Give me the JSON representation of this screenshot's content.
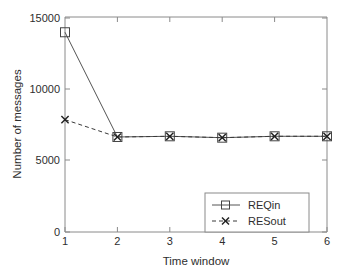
{
  "chart_data": {
    "type": "line",
    "title": "",
    "xlabel": "Time window",
    "ylabel": "Number of messages",
    "x": [
      1,
      2,
      3,
      4,
      5,
      6
    ],
    "xlim": [
      1,
      6
    ],
    "ylim": [
      0,
      15500
    ],
    "xticks": [
      "1",
      "2",
      "3",
      "4",
      "5",
      "6"
    ],
    "yticks": [
      "0",
      "5000",
      "10000",
      "15000"
    ],
    "ytick_values": [
      0,
      5000,
      10000,
      15000
    ],
    "grid": false,
    "legend_position": "lower right",
    "series": [
      {
        "name": "REQin",
        "values": [
          14400,
          6850,
          6900,
          6800,
          6900,
          6900
        ],
        "marker": "square",
        "linestyle": "solid",
        "color": "#555555"
      },
      {
        "name": "RESout",
        "values": [
          8100,
          6850,
          6900,
          6800,
          6900,
          6900
        ],
        "marker": "x",
        "linestyle": "dashed",
        "color": "#3a3a3a"
      }
    ]
  },
  "axes": {
    "x_axis_label": "Time window",
    "y_axis_label": "Number of messages"
  },
  "legend": {
    "entries": [
      {
        "label": "REQin",
        "marker": "square-marker",
        "line": "solid"
      },
      {
        "label": "RESout",
        "marker": "x-marker",
        "line": "dashed"
      }
    ]
  }
}
